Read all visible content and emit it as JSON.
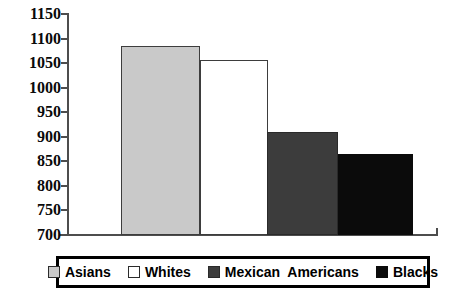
{
  "chart_data": {
    "type": "bar",
    "title": "",
    "subtitle": "",
    "xlabel": "",
    "ylabel": "",
    "categories": [
      "Asians",
      "Whites",
      "Mexican  Americans",
      "Blacks"
    ],
    "values": [
      1085,
      1057,
      910,
      865
    ],
    "ylim": [
      700,
      1150
    ],
    "yticks": [
      700,
      750,
      800,
      850,
      900,
      950,
      1000,
      1050,
      1100,
      1150
    ],
    "ytick_labels": [
      "700",
      "750",
      "800",
      "850",
      "900",
      "950",
      "1000",
      "1050",
      "1100",
      "1150"
    ],
    "xticks": [],
    "xtick_labels": [],
    "grid": false,
    "legend_position": "bottom",
    "series": [
      {
        "name": "Asians",
        "value": 1085,
        "color": "#c9c9c9",
        "edge_color": "#3d3d3d"
      },
      {
        "name": "Whites",
        "value": 1057,
        "color": "#ffffff",
        "edge_color": "#3d3d3d"
      },
      {
        "name": "Mexican  Americans",
        "value": 910,
        "color": "#3c3c3c",
        "edge_color": "#2a2a2a"
      },
      {
        "name": "Blacks",
        "value": 865,
        "color": "#0b0b0b",
        "edge_color": "#0b0b0b"
      }
    ]
  },
  "legend": {
    "entries": [
      {
        "label": "Asians",
        "swatch": "asians"
      },
      {
        "label": "Whites",
        "swatch": "whites"
      },
      {
        "label": "Mexican  Americans",
        "swatch": "mexican"
      },
      {
        "label": "Blacks",
        "swatch": "blacks"
      }
    ]
  },
  "colors": {
    "axis": "#4d4d4d",
    "text": "#0a0a0a",
    "legend_border": "#000000",
    "background": "#ffffff"
  }
}
